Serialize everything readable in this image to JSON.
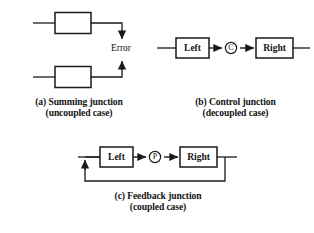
{
  "figure": {
    "background_color": "#ffffff",
    "line_color": "#1a1a1a"
  },
  "panels": [
    {
      "id": "a",
      "caption_line1": "(a) Summing junction",
      "caption_line2": "(uncoupled case)",
      "blocks": [
        {
          "name": "upper-block",
          "label": ""
        },
        {
          "name": "lower-block",
          "label": ""
        }
      ],
      "labels": [
        {
          "name": "error-label",
          "text": "Error"
        }
      ]
    },
    {
      "id": "b",
      "caption_line1": "(b) Control junction",
      "caption_line2": "(decoupled case)",
      "blocks": [
        {
          "name": "left-block",
          "label": "Left"
        },
        {
          "name": "right-block",
          "label": "Right"
        }
      ],
      "junction": {
        "name": "control-junction-symbol",
        "symbol": "C"
      }
    },
    {
      "id": "c",
      "caption_line1": "(c) Feedback junction",
      "caption_line2": "(coupled case)",
      "blocks": [
        {
          "name": "left-block",
          "label": "Left"
        },
        {
          "name": "right-block",
          "label": "Right"
        }
      ],
      "junction": {
        "name": "feedback-junction-symbol",
        "symbol": "P"
      }
    }
  ]
}
